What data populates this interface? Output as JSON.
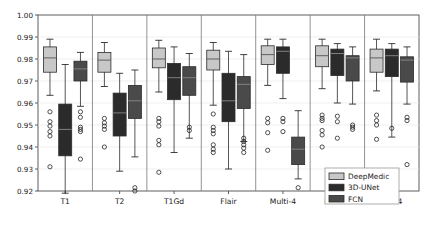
{
  "chart_data": {
    "type": "box",
    "title": "",
    "xlabel": "",
    "ylabel": "",
    "ylim": [
      0.92,
      1.0
    ],
    "ytick_labels": [
      "1.00",
      "0.99",
      "0.98",
      "0.97",
      "0.96",
      "0.95",
      "0.94",
      "0.93",
      "0.92"
    ],
    "ytick_values": [
      1.0,
      0.99,
      0.98,
      0.97,
      0.96,
      0.95,
      0.94,
      0.93,
      0.92
    ],
    "grid": true,
    "legend_position": "bottom-right",
    "categories": [
      "T1",
      "T2",
      "T1Gd",
      "Flair",
      "Multi-4",
      "Multi-2",
      "Ens-4"
    ],
    "series": [
      {
        "name": "DeepMedic",
        "color": "#c8c8c8"
      },
      {
        "name": "3D-UNet",
        "color": "#2b2b2b"
      },
      {
        "name": "FCN",
        "color": "#4a4a4a"
      }
    ],
    "boxes": [
      {
        "category": "T1",
        "series": "DeepMedic",
        "whisker_low": 0.9635,
        "q1": 0.974,
        "median": 0.9805,
        "q3": 0.9855,
        "whisker_high": 0.989,
        "outliers": [
          0.956,
          0.9515,
          0.9495,
          0.947,
          0.945,
          0.931
        ]
      },
      {
        "category": "T1",
        "series": "3D-UNet",
        "whisker_low": 0.919,
        "q1": 0.936,
        "median": 0.948,
        "q3": 0.9595,
        "whisker_high": 0.9775,
        "outliers": []
      },
      {
        "category": "T1",
        "series": "FCN",
        "whisker_low": 0.9585,
        "q1": 0.97,
        "median": 0.9755,
        "q3": 0.979,
        "whisker_high": 0.983,
        "outliers": [
          0.956,
          0.9535,
          0.949,
          0.948,
          0.947,
          0.9345
        ]
      },
      {
        "category": "T2",
        "series": "DeepMedic",
        "whisker_low": 0.9675,
        "q1": 0.974,
        "median": 0.9795,
        "q3": 0.983,
        "whisker_high": 0.9875,
        "outliers": [
          0.953,
          0.951,
          0.9495,
          0.948,
          0.94
        ]
      },
      {
        "category": "T2",
        "series": "3D-UNet",
        "whisker_low": 0.929,
        "q1": 0.945,
        "median": 0.9555,
        "q3": 0.9645,
        "whisker_high": 0.9735,
        "outliers": []
      },
      {
        "category": "T2",
        "series": "FCN",
        "whisker_low": 0.9355,
        "q1": 0.953,
        "median": 0.961,
        "q3": 0.968,
        "whisker_high": 0.975,
        "outliers": [
          0.9215,
          0.92
        ]
      },
      {
        "category": "T1Gd",
        "series": "DeepMedic",
        "whisker_low": 0.965,
        "q1": 0.976,
        "median": 0.98,
        "q3": 0.985,
        "whisker_high": 0.9885,
        "outliers": [
          0.953,
          0.9515,
          0.9495,
          0.943,
          0.941,
          0.9285
        ]
      },
      {
        "category": "T1Gd",
        "series": "3D-UNet",
        "whisker_low": 0.9375,
        "q1": 0.9615,
        "median": 0.9715,
        "q3": 0.978,
        "whisker_high": 0.9855,
        "outliers": []
      },
      {
        "category": "T1Gd",
        "series": "FCN",
        "whisker_low": 0.944,
        "q1": 0.9635,
        "median": 0.9715,
        "q3": 0.9765,
        "whisker_high": 0.9825,
        "outliers": [
          0.949,
          0.9475
        ]
      },
      {
        "category": "Flair",
        "series": "DeepMedic",
        "whisker_low": 0.959,
        "q1": 0.975,
        "median": 0.98,
        "q3": 0.984,
        "whisker_high": 0.9875,
        "outliers": [
          0.955,
          0.949,
          0.9475,
          0.946,
          0.941,
          0.939,
          0.9375
        ]
      },
      {
        "category": "Flair",
        "series": "3D-UNet",
        "whisker_low": 0.93,
        "q1": 0.9515,
        "median": 0.961,
        "q3": 0.9735,
        "whisker_high": 0.9835,
        "outliers": []
      },
      {
        "category": "Flair",
        "series": "FCN",
        "whisker_low": 0.9425,
        "q1": 0.9575,
        "median": 0.9685,
        "q3": 0.972,
        "whisker_high": 0.982,
        "outliers": [
          0.944,
          0.9425,
          0.941,
          0.9395,
          0.9375
        ]
      },
      {
        "category": "Multi-4",
        "series": "DeepMedic",
        "whisker_low": 0.968,
        "q1": 0.9775,
        "median": 0.982,
        "q3": 0.986,
        "whisker_high": 0.989,
        "outliers": [
          0.953,
          0.951,
          0.9465,
          0.9385
        ]
      },
      {
        "category": "Multi-4",
        "series": "3D-UNet",
        "whisker_low": 0.962,
        "q1": 0.9735,
        "median": 0.9835,
        "q3": 0.9855,
        "whisker_high": 0.989,
        "outliers": [
          0.953,
          0.9515,
          0.947
        ]
      },
      {
        "category": "Multi-4",
        "series": "FCN",
        "whisker_low": 0.9255,
        "q1": 0.932,
        "median": 0.939,
        "q3": 0.9445,
        "whisker_high": 0.9565,
        "outliers": [
          0.9215
        ]
      },
      {
        "category": "Multi-2",
        "series": "DeepMedic",
        "whisker_low": 0.9665,
        "q1": 0.9765,
        "median": 0.9815,
        "q3": 0.986,
        "whisker_high": 0.989,
        "outliers": [
          0.9545,
          0.953,
          0.952,
          0.9475,
          0.9455,
          0.94
        ]
      },
      {
        "category": "Multi-2",
        "series": "3D-UNet",
        "whisker_low": 0.96,
        "q1": 0.9725,
        "median": 0.9825,
        "q3": 0.9845,
        "whisker_high": 0.987,
        "outliers": [
          0.954,
          0.9515,
          0.944
        ]
      },
      {
        "category": "Multi-2",
        "series": "FCN",
        "whisker_low": 0.9595,
        "q1": 0.97,
        "median": 0.9805,
        "q3": 0.9815,
        "whisker_high": 0.9855,
        "outliers": [
          0.95,
          0.949,
          0.948
        ]
      },
      {
        "category": "Ens-4",
        "series": "DeepMedic",
        "whisker_low": 0.9655,
        "q1": 0.974,
        "median": 0.9805,
        "q3": 0.9845,
        "whisker_high": 0.989,
        "outliers": [
          0.9545,
          0.952,
          0.95,
          0.9435
        ]
      },
      {
        "category": "Ens-4",
        "series": "3D-UNet",
        "whisker_low": 0.9445,
        "q1": 0.972,
        "median": 0.9815,
        "q3": 0.9845,
        "whisker_high": 0.987,
        "outliers": [
          0.9485
        ]
      },
      {
        "category": "Ens-4",
        "series": "FCN",
        "whisker_low": 0.9595,
        "q1": 0.9695,
        "median": 0.9795,
        "q3": 0.981,
        "whisker_high": 0.9855,
        "outliers": [
          0.9535,
          0.952,
          0.932
        ]
      }
    ]
  },
  "legend": {
    "items": [
      {
        "label": "DeepMedic",
        "color": "#c8c8c8"
      },
      {
        "label": "3D-UNet",
        "color": "#2b2b2b"
      },
      {
        "label": "FCN",
        "color": "#4a4a4a"
      }
    ]
  },
  "axes": {
    "y_top_label": "1.00",
    "y_bottom_label": "0.92"
  }
}
